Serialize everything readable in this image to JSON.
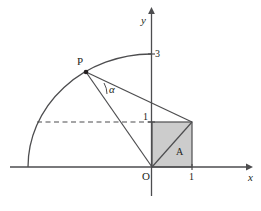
{
  "figure": {
    "title": "",
    "type": "geometry-diagram",
    "canvas": {
      "width": 261,
      "height": 211
    },
    "colors": {
      "stroke": "#4d4d4f",
      "text": "#231f20",
      "shaded_fill": "#cccccc",
      "background": "#ffffff"
    },
    "axes": {
      "x_label": "x",
      "y_label": "y",
      "origin_label": "O"
    },
    "ticks": [
      {
        "name": "y-tick-3",
        "label": "3",
        "axis": "y",
        "value": 3
      },
      {
        "name": "y-tick-1",
        "label": "1",
        "axis": "y",
        "value": 1
      },
      {
        "name": "x-tick-1",
        "label": "1",
        "axis": "x",
        "value": 1
      }
    ],
    "points": [
      {
        "name": "point-P",
        "label": "P"
      },
      {
        "name": "point-O",
        "label": "O"
      }
    ],
    "angles": [
      {
        "name": "angle-alpha",
        "label": "α",
        "vertex": "P"
      }
    ],
    "regions": [
      {
        "name": "shaded-square",
        "label": "A",
        "fill": "#cccccc"
      }
    ],
    "elements": {
      "arc": "quarter-circle-radius-3",
      "dashed_line": "horizontal-dashed-at-y-1",
      "segment_P_to_O": "line-from-P-to-origin",
      "segment_P_to_corner": "line-from-P-to-square-top-right",
      "square_diagonal": "diagonal-of-unit-square"
    }
  }
}
